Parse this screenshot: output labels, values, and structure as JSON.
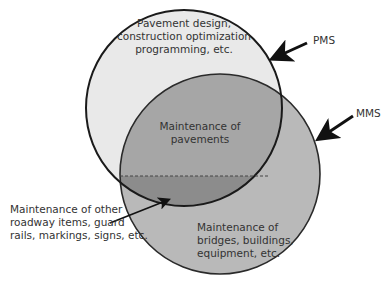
{
  "diagram": {
    "type": "venn",
    "sets": [
      {
        "id": "PMS",
        "label": "PMS",
        "description_lines": [
          "Pavement design,",
          "construction optimization",
          "programming, etc."
        ]
      },
      {
        "id": "MMS",
        "label": "MMS",
        "description_lines": [
          "Maintenance of",
          "bridges, buildings,",
          "equipment, etc."
        ]
      }
    ],
    "intersection": {
      "upper_lines": [
        "Maintenance of",
        "pavements"
      ],
      "lower_callout_lines": [
        "Maintenance of other",
        "roadway items, guard",
        "rails, markings, signs, etc."
      ]
    },
    "colors": {
      "pms_only": "#e9e9e9",
      "mms_only": "#b9b9b9",
      "intersection_upper": "#a6a6a6",
      "intersection_lower": "#8c8c8c",
      "outline": "#222222"
    }
  }
}
